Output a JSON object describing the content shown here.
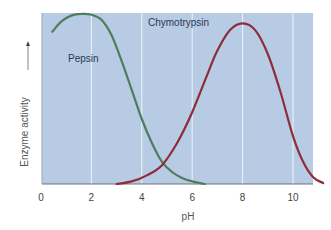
{
  "chart_data": {
    "type": "line",
    "title": "",
    "xlabel": "pH",
    "ylabel": "Enzyme activity",
    "ylabel_arrow": "up",
    "xlim": [
      0,
      11.3
    ],
    "ylim": [
      0,
      100
    ],
    "xticks": [
      0,
      2,
      4,
      6,
      8,
      10
    ],
    "xtick_labels": [
      "0",
      "2",
      "4",
      "6",
      "8",
      "10"
    ],
    "yticks": [],
    "grid": {
      "vertical": true,
      "horizontal": false,
      "positions": [
        2,
        4,
        6,
        8,
        10
      ]
    },
    "legend": "inline labels",
    "colors": {
      "background": "#b7cce4",
      "grid": "#eef3fa",
      "axis": "#6a7078",
      "pepsin": "#4e7d5e",
      "chymotrypsin": "#8e2c3a"
    },
    "series": [
      {
        "name": "Pepsin",
        "color": "#4e7d5e",
        "label_pos": [
          2.6,
          73
        ],
        "x": [
          0.45,
          0.8,
          1.2,
          1.6,
          2.0,
          2.4,
          2.8,
          3.2,
          3.6,
          4.0,
          4.4,
          4.8,
          5.2,
          5.6,
          6.0,
          6.5
        ],
        "y": [
          89,
          95,
          98.5,
          99.5,
          99,
          96,
          87,
          72,
          55,
          38,
          24,
          13,
          7,
          3.5,
          1.5,
          0
        ]
      },
      {
        "name": "Chymotrypsin",
        "color": "#8e2c3a",
        "label_pos": [
          6.55,
          94
        ],
        "x": [
          3.0,
          3.6,
          4.2,
          4.8,
          5.4,
          6.0,
          6.6,
          7.0,
          7.5,
          8.0,
          8.5,
          9.0,
          9.5,
          10.0,
          10.4,
          10.8,
          11.2
        ],
        "y": [
          0,
          1.5,
          5,
          11,
          24,
          42,
          64,
          78,
          90,
          94,
          90,
          76,
          54,
          28,
          13,
          4,
          0.5
        ]
      }
    ]
  }
}
